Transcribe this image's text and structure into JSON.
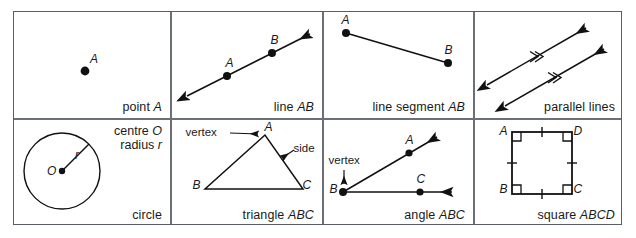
{
  "figure": {
    "rows": 2,
    "columns": 4,
    "line_color": "#111111",
    "border_color": "#5a5f66",
    "background": "#ffffff"
  },
  "cells": [
    {
      "id": "point",
      "caption_prefix": "point ",
      "caption_symbol": "A",
      "labels": {
        "a": "A"
      }
    },
    {
      "id": "line",
      "caption_prefix": "line ",
      "caption_symbol": "AB",
      "labels": {
        "a": "A",
        "b": "B"
      }
    },
    {
      "id": "line-segment",
      "caption_prefix": "line segment ",
      "caption_symbol": "AB",
      "labels": {
        "a": "A",
        "b": "B"
      }
    },
    {
      "id": "parallel-lines",
      "caption_prefix": "parallel lines",
      "caption_symbol": "",
      "labels": {}
    },
    {
      "id": "circle",
      "caption_prefix": "circle",
      "caption_symbol": "",
      "labels": {
        "o": "O",
        "r": "r"
      },
      "notes": {
        "centre_prefix": "centre ",
        "centre_symbol": "O",
        "radius_prefix": "radius ",
        "radius_symbol": "r"
      }
    },
    {
      "id": "triangle",
      "caption_prefix": "triangle ",
      "caption_symbol": "ABC",
      "labels": {
        "a": "A",
        "b": "B",
        "c": "C"
      },
      "annotations": {
        "vertex": "vertex",
        "side": "side"
      }
    },
    {
      "id": "angle",
      "caption_prefix": "angle ",
      "caption_symbol": "ABC",
      "labels": {
        "a": "A",
        "b": "B",
        "c": "C"
      },
      "annotations": {
        "vertex": "vertex"
      }
    },
    {
      "id": "square",
      "caption_prefix": "square ",
      "caption_symbol": "ABCD",
      "labels": {
        "a": "A",
        "b": "B",
        "c": "C",
        "d": "D"
      }
    }
  ]
}
